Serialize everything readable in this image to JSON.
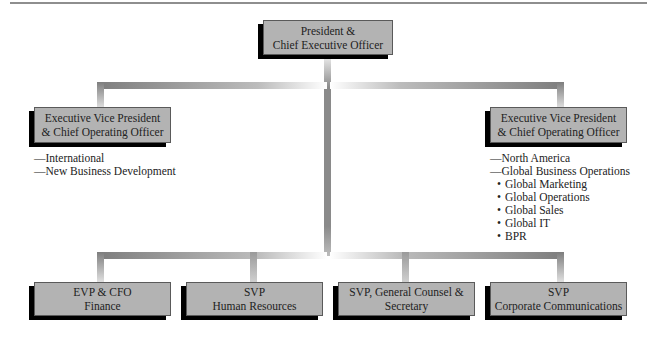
{
  "chart": {
    "type": "org-chart",
    "top": {
      "line1": "President &",
      "line2": "Chief Executive Officer"
    },
    "evp_left": {
      "line1": "Executive Vice President",
      "line2": "& Chief Operating Officer",
      "responsibilities": [
        "—International",
        "—New Business Development"
      ]
    },
    "evp_right": {
      "line1": "Executive Vice President",
      "line2": "& Chief Operating Officer",
      "responsibilities": [
        "—North America",
        "—Global Business Operations"
      ],
      "sub_responsibilities": [
        "Global Marketing",
        "Global Operations",
        "Global Sales",
        "Global IT",
        "BPR"
      ]
    },
    "bottom": [
      {
        "line1": "EVP & CFO",
        "line2": "Finance"
      },
      {
        "line1": "SVP",
        "line2": "Human Resources"
      },
      {
        "line1": "SVP, General Counsel &",
        "line2": "Secretary"
      },
      {
        "line1": "SVP",
        "line2": "Corporate Communications"
      }
    ],
    "colors": {
      "box_fill": "#b3b3b3",
      "box_shadow": "#000000",
      "connector": "#8a8a8a"
    }
  }
}
